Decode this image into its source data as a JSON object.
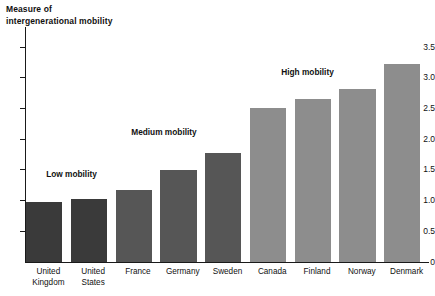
{
  "chart_data": {
    "type": "bar",
    "title": "Measure of\nintergenerational mobility",
    "xlabel": "",
    "ylabel": "Measure of intergenerational mobility",
    "ylim": [
      0,
      3.5
    ],
    "grid": false,
    "legend": "none",
    "categories": [
      "United\nKingdom",
      "United\nStates",
      "France",
      "Germany",
      "Sweden",
      "Canada",
      "Finland",
      "Norway",
      "Denmark"
    ],
    "values": [
      0.97,
      1.02,
      1.17,
      1.5,
      1.78,
      2.51,
      2.66,
      2.82,
      3.22
    ],
    "bar_colors": [
      "#3a3a3a",
      "#3a3a3a",
      "#565656",
      "#565656",
      "#565656",
      "#8d8d8d",
      "#8d8d8d",
      "#8d8d8d",
      "#8d8d8d"
    ],
    "ytick_labels": [
      "0",
      "0.5",
      "1.0",
      "1.5",
      "2.0",
      "2.5",
      "3.0",
      "3.5"
    ],
    "ytick_values": [
      0,
      0.5,
      1.0,
      1.5,
      2.0,
      2.5,
      3.0,
      3.5
    ],
    "annotations": [
      {
        "text": "Low mobility",
        "x_index": 0.45,
        "value": 1.42
      },
      {
        "text": "Medium mobility",
        "x_index": 2.35,
        "value": 2.1
      },
      {
        "text": "High mobility",
        "x_index": 5.7,
        "value": 3.08
      }
    ]
  },
  "colors": {
    "axis": "#1a1a1a",
    "text": "#111111",
    "background": "#ffffff",
    "low_mobility_bar": "#3a3a3a",
    "medium_mobility_bar": "#565656",
    "high_mobility_bar": "#8d8d8d"
  }
}
